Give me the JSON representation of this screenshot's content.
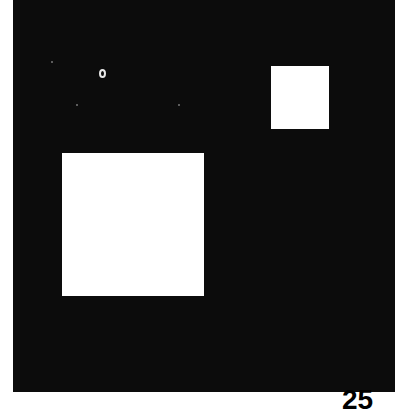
{
  "image": {
    "description": "Black field with two white squares of different sizes and a small ring artifact",
    "background_color": "#0c0c0c",
    "shape_color": "#ffffff",
    "shapes": [
      {
        "type": "square",
        "size": "large"
      },
      {
        "type": "square",
        "size": "small"
      },
      {
        "type": "ring",
        "size": "tiny"
      }
    ],
    "corner_label": "25"
  }
}
